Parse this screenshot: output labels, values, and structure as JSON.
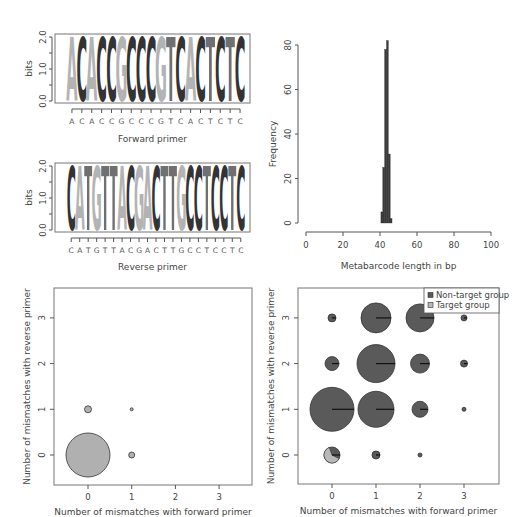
{
  "chart_data": [
    {
      "type": "sequence-logo",
      "panel": "top-left",
      "title": "",
      "xlabel": "Forward primer",
      "ylabel": "bits",
      "yticks": [
        "0.0",
        "1.0",
        "2.0"
      ],
      "ylim": [
        0,
        2
      ],
      "sequence": [
        "A",
        "C",
        "A",
        "C",
        "C",
        "G",
        "C",
        "C",
        "C",
        "G",
        "T",
        "C",
        "A",
        "C",
        "T",
        "C",
        "T",
        "C"
      ],
      "letter_colors": {
        "A": "#b3b3b3",
        "C": "#333333",
        "G": "#b3b3b3",
        "T": "#707070"
      }
    },
    {
      "type": "sequence-logo",
      "panel": "middle-left",
      "title": "",
      "xlabel": "Reverse primer",
      "ylabel": "bits",
      "yticks": [
        "0.0",
        "1.0",
        "2.0"
      ],
      "ylim": [
        0,
        2
      ],
      "sequence": [
        "C",
        "A",
        "T",
        "G",
        "T",
        "T",
        "A",
        "C",
        "G",
        "A",
        "C",
        "T",
        "T",
        "G",
        "C",
        "C",
        "T",
        "C",
        "C",
        "T",
        "C"
      ],
      "letter_colors": {
        "A": "#b3b3b3",
        "C": "#333333",
        "G": "#b3b3b3",
        "T": "#707070"
      }
    },
    {
      "type": "bar",
      "panel": "top-right",
      "title": "",
      "xlabel": "Metabarcode length in bp",
      "ylabel": "Frequency",
      "xlim": [
        0,
        100
      ],
      "ylim": [
        0,
        80
      ],
      "xticks": [
        "0",
        "20",
        "40",
        "60",
        "80",
        "100"
      ],
      "yticks": [
        "0",
        "20",
        "40",
        "60",
        "80"
      ],
      "categories": [
        41,
        42,
        43,
        44,
        45,
        46
      ],
      "values": [
        5,
        25,
        78,
        82,
        31,
        2
      ],
      "bar_color": "#3a3a3a"
    },
    {
      "type": "scatter",
      "panel": "bottom-left",
      "title": "",
      "xlabel": "Number of mismatches with forward primer",
      "ylabel": "Number of mismatches with reverse primer",
      "xticks": [
        "0",
        "1",
        "2",
        "3"
      ],
      "yticks": [
        "0",
        "1",
        "2",
        "3"
      ],
      "xlim": [
        -0.5,
        3.5
      ],
      "ylim": [
        -0.5,
        3.5
      ],
      "points": [
        {
          "x": 0,
          "y": 0,
          "radius": 22,
          "color": "#b0b0b0"
        },
        {
          "x": 0,
          "y": 1,
          "radius": 3.5,
          "color": "#b0b0b0"
        },
        {
          "x": 1,
          "y": 0,
          "radius": 3,
          "color": "#b0b0b0"
        },
        {
          "x": 1,
          "y": 1,
          "radius": 1.5,
          "color": "#b0b0b0"
        }
      ]
    },
    {
      "type": "pie",
      "panel": "bottom-right",
      "title": "",
      "xlabel": "Number of mismatches with forward primer",
      "ylabel": "Number of mismatches with reverse primer",
      "xticks": [
        "0",
        "1",
        "2",
        "3"
      ],
      "yticks": [
        "0",
        "1",
        "2",
        "3"
      ],
      "xlim": [
        -0.5,
        3.5
      ],
      "ylim": [
        -0.5,
        3.5
      ],
      "legend": [
        {
          "label": "Non-target group",
          "color": "#5a5a5a"
        },
        {
          "label": "Target group",
          "color": "#b8b8b8"
        }
      ],
      "legend_position": "top-right",
      "points": [
        {
          "x": 0,
          "y": 0,
          "radius": 8,
          "target_fraction": 0.62
        },
        {
          "x": 1,
          "y": 0,
          "radius": 4,
          "target_fraction": 0.02
        },
        {
          "x": 2,
          "y": 0,
          "radius": 2,
          "target_fraction": 0
        },
        {
          "x": 0,
          "y": 1,
          "radius": 22,
          "target_fraction": 0
        },
        {
          "x": 1,
          "y": 1,
          "radius": 18,
          "target_fraction": 0
        },
        {
          "x": 2,
          "y": 1,
          "radius": 8,
          "target_fraction": 0
        },
        {
          "x": 3,
          "y": 1,
          "radius": 2,
          "target_fraction": 0
        },
        {
          "x": 0,
          "y": 2,
          "radius": 7,
          "target_fraction": 0
        },
        {
          "x": 1,
          "y": 2,
          "radius": 19,
          "target_fraction": 0
        },
        {
          "x": 2,
          "y": 2,
          "radius": 9.5,
          "target_fraction": 0
        },
        {
          "x": 3,
          "y": 2,
          "radius": 3.5,
          "target_fraction": 0
        },
        {
          "x": 0,
          "y": 3,
          "radius": 4,
          "target_fraction": 0
        },
        {
          "x": 1,
          "y": 3,
          "radius": 15,
          "target_fraction": 0
        },
        {
          "x": 2,
          "y": 3,
          "radius": 14,
          "target_fraction": 0
        },
        {
          "x": 3,
          "y": 3,
          "radius": 3,
          "target_fraction": 0
        }
      ]
    }
  ]
}
